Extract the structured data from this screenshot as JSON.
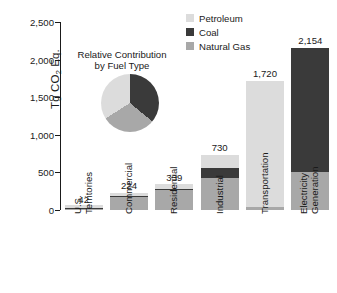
{
  "chart_data": {
    "type": "bar",
    "title": "",
    "xlabel": "",
    "ylabel": "Tg CO2 Eq.",
    "ylabel_parts": {
      "pre": "Tg CO",
      "sub": "2",
      "post": " Eq."
    },
    "ylim": [
      0,
      2500
    ],
    "yticks": [
      0,
      500,
      1000,
      1500,
      2000,
      2500
    ],
    "ytick_labels": [
      "0",
      "500",
      "1,000",
      "1,500",
      "2,000",
      "2,500"
    ],
    "grid": false,
    "stacked": true,
    "legend_position": "top-right",
    "categories": [
      "U.S. Territories",
      "Commercial",
      "Residential",
      "Industrial",
      "Transportation",
      "Electricity Generation"
    ],
    "category_label_lines": [
      [
        "U.S.",
        "Territories"
      ],
      [
        "Commercial"
      ],
      [
        "Residential"
      ],
      [
        "Industrial"
      ],
      [
        "Transportation"
      ],
      [
        "Electricity",
        "Generation"
      ]
    ],
    "totals": [
      42,
      224,
      339,
      730,
      1720,
      2154
    ],
    "total_labels": [
      "42",
      "224",
      "339",
      "730",
      "1,720",
      "2,154"
    ],
    "series": [
      {
        "name": "Natural Gas",
        "color": "#a8a8a8",
        "values": [
          3,
          170,
          262,
          430,
          35,
          510
        ]
      },
      {
        "name": "Coal",
        "color": "#3a3a3a",
        "values": [
          2,
          14,
          10,
          125,
          0,
          1644
        ]
      },
      {
        "name": "Petroleum",
        "color": "#dcdcdc",
        "values": [
          37,
          40,
          67,
          175,
          1685,
          0
        ]
      }
    ]
  },
  "legend": {
    "items": [
      {
        "label": "Petroleum",
        "color": "#dcdcdc"
      },
      {
        "label": "Coal",
        "color": "#3a3a3a"
      },
      {
        "label": "Natural Gas",
        "color": "#a8a8a8"
      }
    ]
  },
  "inset_pie": {
    "title_line1": "Relative Contribution",
    "title_line2": "by Fuel Type",
    "type": "pie",
    "labels": [
      "Coal",
      "Natural Gas",
      "Petroleum"
    ],
    "values": [
      36,
      30,
      34
    ],
    "colors": [
      "#3a3a3a",
      "#a8a8a8",
      "#dcdcdc"
    ]
  },
  "colors": {
    "petroleum": "#dcdcdc",
    "coal": "#3a3a3a",
    "natural_gas": "#a8a8a8",
    "axis": "#1a1a1a",
    "background": "#ffffff"
  }
}
